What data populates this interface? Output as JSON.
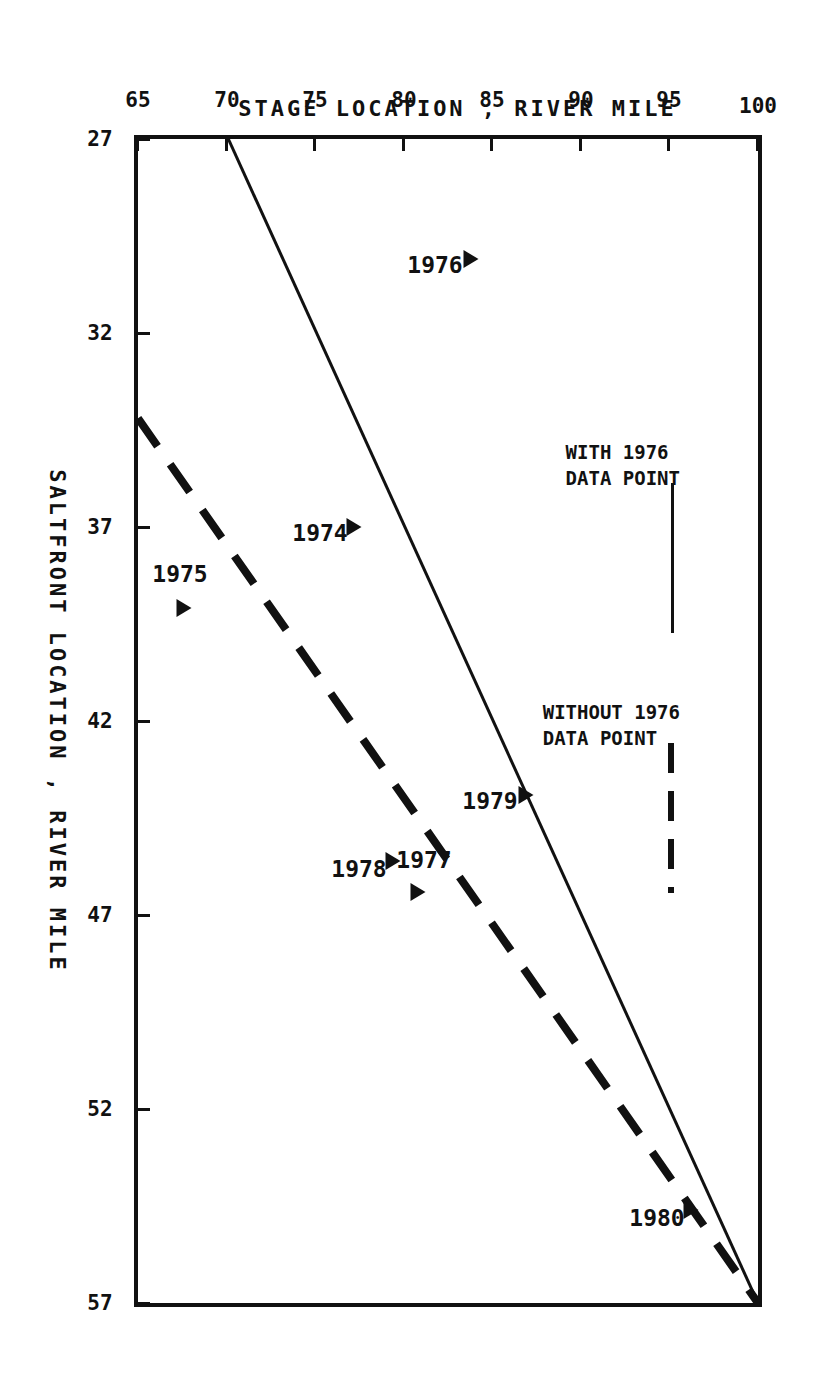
{
  "figure": {
    "background": "#ffffff",
    "ink": "#111111",
    "orientation": "rotated-90-clockwise"
  },
  "chart_data": {
    "type": "scatter",
    "title": "",
    "xlabel": "SALTFRONT LOCATION , RIVER MILE",
    "ylabel": "STAGE LOCATION , RIVER MILE",
    "xlim": [
      27,
      57
    ],
    "ylim": [
      65,
      100
    ],
    "xticks": [
      27,
      32,
      37,
      42,
      47,
      52,
      57
    ],
    "xtick_labels": [
      "27",
      "32",
      "37",
      "42",
      "47",
      "52",
      "57"
    ],
    "yticks": [
      65,
      70,
      75,
      80,
      85,
      90,
      95,
      100
    ],
    "ytick_labels": [
      "65",
      "70",
      "75",
      "80",
      "85",
      "90",
      "95",
      "100"
    ],
    "grid": false,
    "legend_position": "upper-left",
    "points": [
      {
        "label": "1974",
        "x": 37.0,
        "y": 77.2
      },
      {
        "label": "1975",
        "x": 39.1,
        "y": 67.6
      },
      {
        "label": "1976",
        "x": 30.1,
        "y": 83.8
      },
      {
        "label": "1977",
        "x": 46.4,
        "y": 80.8
      },
      {
        "label": "1978",
        "x": 45.6,
        "y": 79.4
      },
      {
        "label": "1979",
        "x": 43.9,
        "y": 86.9
      },
      {
        "label": "1980",
        "x": 54.6,
        "y": 96.2
      }
    ],
    "series": [
      {
        "name": "WITH 1976 DATA POINT",
        "style": "solid",
        "x": [
          27.0,
          57.0
        ],
        "y": [
          70.1,
          100.0
        ]
      },
      {
        "name": "WITHOUT 1976 DATA POINT",
        "style": "dashed",
        "x": [
          34.2,
          57.0
        ],
        "y": [
          65.0,
          100.0
        ]
      }
    ]
  },
  "legend": {
    "entries": [
      {
        "label_line1": "WITH 1976",
        "label_line2": "DATA POINT",
        "style": "solid"
      },
      {
        "label_line1": "WITHOUT 1976",
        "label_line2": "DATA POINT",
        "style": "dashed"
      }
    ]
  }
}
